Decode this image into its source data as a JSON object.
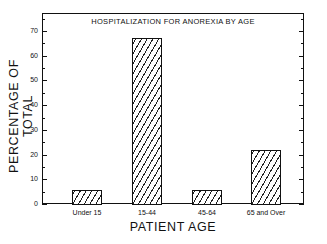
{
  "chart_data": {
    "type": "bar",
    "title": "HOSPITALIZATION FOR ANOREXIA BY AGE",
    "xlabel": "PATIENT AGE",
    "ylabel": "PERCENTAGE OF TOTAL",
    "categories": [
      "Under 15",
      "15-44",
      "45-64",
      "65 and Over"
    ],
    "values": [
      5.5,
      67,
      5.5,
      22
    ],
    "ylim": [
      0,
      77
    ],
    "yticks": [
      0,
      10,
      20,
      30,
      40,
      50,
      60,
      70
    ],
    "minor_yticks_step": 5,
    "grid": false,
    "legend": null,
    "bar_fill": "diagonal-hatch",
    "colors": {
      "bar_edge": "#111111",
      "hatch": "#222222",
      "background": "#ffffff"
    }
  }
}
